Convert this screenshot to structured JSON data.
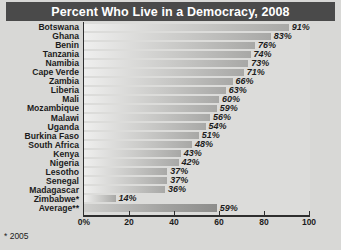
{
  "chart_data": {
    "type": "bar",
    "orientation": "horizontal",
    "title": "Percent Who Live in a Democracy, 2008",
    "xlabel": "",
    "ylabel": "",
    "xlim": [
      0,
      100
    ],
    "grid": false,
    "legend": null,
    "categories": [
      "Botswana",
      "Ghana",
      "Benin",
      "Tanzania",
      "Namibia",
      "Cape Verde",
      "Zambia",
      "Liberia",
      "Mali",
      "Mozambique",
      "Malawi",
      "Uganda",
      "Burkina Faso",
      "South Africa",
      "Kenya",
      "Nigeria",
      "Lesotho",
      "Senegal",
      "Madagascar",
      "Zimbabwe*",
      "Average**"
    ],
    "values": [
      91,
      83,
      76,
      74,
      73,
      71,
      66,
      63,
      60,
      59,
      56,
      54,
      51,
      48,
      43,
      42,
      37,
      37,
      36,
      14,
      59
    ],
    "value_labels": [
      "91%",
      "83%",
      "76%",
      "74%",
      "73%",
      "71%",
      "66%",
      "63%",
      "60%",
      "59%",
      "56%",
      "54%",
      "51%",
      "48%",
      "43%",
      "42%",
      "37%",
      "37%",
      "36%",
      "14%",
      "59%"
    ],
    "xticks": [
      0,
      20,
      40,
      60,
      80,
      100
    ],
    "xtick_labels": [
      "0%",
      "20",
      "40",
      "60",
      "80",
      "100"
    ],
    "annotations": [
      "* 2005"
    ]
  }
}
